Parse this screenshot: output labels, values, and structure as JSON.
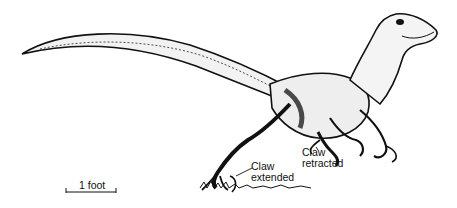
{
  "figure": {
    "annotations": {
      "claw_extended": {
        "line1": "Claw",
        "line2": "extended"
      },
      "claw_retracted": {
        "line1": "Claw",
        "line2": "retracted"
      }
    },
    "scale_bar": {
      "label": "1 foot"
    }
  },
  "colors": {
    "ink": "#111111",
    "background": "#ffffff"
  }
}
